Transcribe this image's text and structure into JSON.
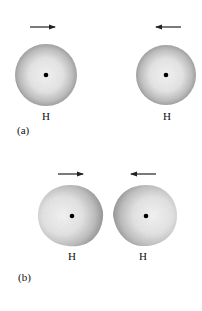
{
  "figure": {
    "panels": [
      {
        "label": "(a)",
        "description": "Two separated hydrogen atoms approaching each other",
        "atoms": [
          {
            "symbol": "H",
            "arrow": "right",
            "shape": "sphere"
          },
          {
            "symbol": "H",
            "arrow": "left",
            "shape": "sphere"
          }
        ]
      },
      {
        "label": "(b)",
        "description": "Hydrogen atoms close together, electron clouds distorted",
        "atoms": [
          {
            "symbol": "H",
            "arrow": "right",
            "shape": "distorted"
          },
          {
            "symbol": "H",
            "arrow": "left",
            "shape": "distorted"
          }
        ]
      }
    ],
    "colors": {
      "cloud_edge": "#9a9a9a",
      "cloud_center": "#f2f2f2",
      "nucleus": "#000000",
      "arrow": "#222222"
    }
  }
}
